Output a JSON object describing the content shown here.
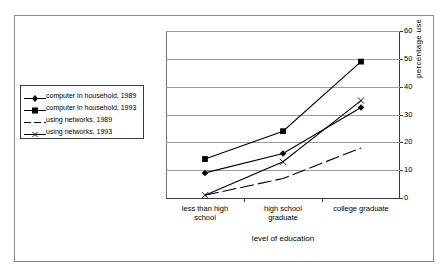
{
  "chart_data": {
    "type": "line",
    "title": "",
    "xlabel": "level of education",
    "ylabel": "percentage  use",
    "categories": [
      "less than high school",
      "high school graduate",
      "college graduate"
    ],
    "category_lines": [
      [
        "less than high",
        "school"
      ],
      [
        "high school",
        "graduate"
      ],
      [
        "college graduate"
      ]
    ],
    "ylim": [
      0,
      60
    ],
    "yticks": [
      0,
      10,
      20,
      30,
      40,
      50,
      60
    ],
    "ytick_labels": [
      "0",
      "10",
      "20",
      "30",
      "40",
      "50",
      "60"
    ],
    "grid": "horizontal",
    "y_axis_position": "right",
    "legend_position": "left-outside",
    "series": [
      {
        "name": "computer in household, 1989",
        "marker": "diamond",
        "line_style": "solid",
        "color": "#000000",
        "values": [
          9,
          16,
          32.5
        ]
      },
      {
        "name": "computer in household, 1993",
        "marker": "square",
        "line_style": "solid",
        "color": "#000000",
        "values": [
          14,
          24,
          49
        ]
      },
      {
        "name": "using networks, 1989",
        "marker": "none",
        "line_style": "dashed",
        "color": "#000000",
        "values": [
          1,
          7,
          18
        ]
      },
      {
        "name": "using networks, 1993",
        "marker": "x",
        "line_style": "solid",
        "color": "#000000",
        "values": [
          1,
          13,
          35
        ]
      }
    ]
  },
  "legend": {
    "items": [
      {
        "label": "computer in household, 1989",
        "marker": "diamond"
      },
      {
        "label": "computer in household, 1993",
        "marker": "square"
      },
      {
        "label": "using networks, 1989",
        "marker": "dashed-line"
      },
      {
        "label": "using networks, 1993",
        "marker": "x-line"
      }
    ]
  }
}
